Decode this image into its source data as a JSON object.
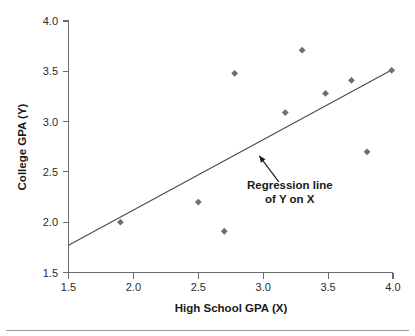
{
  "chart_data": {
    "type": "scatter",
    "title": "",
    "xlabel": "High School GPA (X)",
    "ylabel": "College GPA (Y)",
    "xlim": [
      1.5,
      4.0
    ],
    "ylim": [
      1.5,
      4.0
    ],
    "xticks": [
      "1.5",
      "2.0",
      "2.5",
      "3.0",
      "3.5",
      "4.0"
    ],
    "yticks": [
      "1.5",
      "2.0",
      "2.5",
      "3.0",
      "3.5",
      "4.0"
    ],
    "xtick_values": [
      1.5,
      2.0,
      2.5,
      3.0,
      3.5,
      4.0
    ],
    "ytick_values": [
      1.5,
      2.0,
      2.5,
      3.0,
      3.5,
      4.0
    ],
    "grid": false,
    "legend": false,
    "series": [
      {
        "name": "Students",
        "marker": "diamond",
        "color": "#6e6e75",
        "points": [
          {
            "x": 1.9,
            "y": 2.0
          },
          {
            "x": 2.5,
            "y": 2.2
          },
          {
            "x": 2.7,
            "y": 1.91
          },
          {
            "x": 2.78,
            "y": 3.48
          },
          {
            "x": 3.17,
            "y": 3.09
          },
          {
            "x": 3.3,
            "y": 3.71
          },
          {
            "x": 3.48,
            "y": 3.28
          },
          {
            "x": 3.68,
            "y": 3.41
          },
          {
            "x": 3.8,
            "y": 2.7
          },
          {
            "x": 3.99,
            "y": 3.51
          }
        ]
      }
    ],
    "fit_line": {
      "name": "Regression line of Y on X",
      "color": "#4d4d4d",
      "x_start": 1.5,
      "y_start": 1.77,
      "x_end": 4.0,
      "y_end": 3.52,
      "slope": 0.7,
      "intercept": 0.72
    },
    "annotations": [
      {
        "name": "regression-line-callout",
        "line1": "Regression line",
        "line2": "of Y on X",
        "arrow_tip_x": 2.97,
        "arrow_tip_y": 2.66,
        "arrow_tail_x": 3.12,
        "arrow_tail_y": 2.4
      }
    ]
  },
  "axes": {
    "x_title": "High School GPA (X)",
    "y_title": "College GPA (Y)"
  }
}
